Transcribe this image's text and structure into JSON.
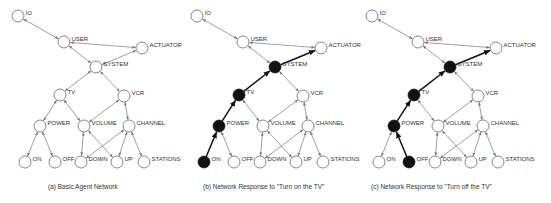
{
  "diagram": {
    "nodes": [
      {
        "id": "IO",
        "label": "IO",
        "x": 18,
        "y": 16
      },
      {
        "id": "USER",
        "label": "USER",
        "x": 64,
        "y": 42
      },
      {
        "id": "ACTUATOR",
        "label": "ACTUATOR",
        "x": 142,
        "y": 48
      },
      {
        "id": "SYSTEM",
        "label": "SYSTEM",
        "x": 96,
        "y": 67
      },
      {
        "id": "TV",
        "label": "TV",
        "x": 60,
        "y": 95
      },
      {
        "id": "VCR",
        "label": "VCR",
        "x": 124,
        "y": 96
      },
      {
        "id": "POWER",
        "label": "POWER",
        "x": 40,
        "y": 126
      },
      {
        "id": "VOLUME",
        "label": "VOLUME",
        "x": 84,
        "y": 126
      },
      {
        "id": "CHANNEL",
        "label": "CHANNEL",
        "x": 129,
        "y": 126
      },
      {
        "id": "ON",
        "label": "ON",
        "x": 25,
        "y": 162
      },
      {
        "id": "OFF",
        "label": "OFF",
        "x": 55,
        "y": 162
      },
      {
        "id": "DOWN",
        "label": "DOWN",
        "x": 81,
        "y": 162
      },
      {
        "id": "UP",
        "label": "UP",
        "x": 117,
        "y": 162
      },
      {
        "id": "STATIONS",
        "label": "STATIONS",
        "x": 144,
        "y": 162
      }
    ],
    "edges": [
      [
        "IO",
        "USER"
      ],
      [
        "USER",
        "ACTUATOR"
      ],
      [
        "USER",
        "SYSTEM"
      ],
      [
        "SYSTEM",
        "ACTUATOR"
      ],
      [
        "SYSTEM",
        "TV"
      ],
      [
        "SYSTEM",
        "VCR"
      ],
      [
        "TV",
        "POWER"
      ],
      [
        "TV",
        "VOLUME"
      ],
      [
        "VCR",
        "VOLUME"
      ],
      [
        "VCR",
        "CHANNEL"
      ],
      [
        "POWER",
        "ON"
      ],
      [
        "POWER",
        "OFF"
      ],
      [
        "VOLUME",
        "DOWN"
      ],
      [
        "VOLUME",
        "UP"
      ],
      [
        "CHANNEL",
        "DOWN"
      ],
      [
        "CHANNEL",
        "UP"
      ],
      [
        "CHANNEL",
        "STATIONS"
      ]
    ],
    "node_radius": 6,
    "colors": {
      "node_fill": "#ffffff",
      "node_stroke": "#555555",
      "active_fill": "#111111",
      "edge": "#777777",
      "active_edge": "#111111"
    }
  },
  "panels": [
    {
      "caption": "(a) Basic Agent Network",
      "offset_x": 0,
      "active_nodes": [],
      "active_path": []
    },
    {
      "caption": "(b) Network Response to \"Turn on the TV\"",
      "offset_x": 179,
      "active_nodes": [
        "ON",
        "POWER",
        "TV",
        "SYSTEM"
      ],
      "active_path": [
        [
          "ON",
          "POWER"
        ],
        [
          "POWER",
          "TV"
        ],
        [
          "TV",
          "SYSTEM"
        ],
        [
          "SYSTEM",
          "ACTUATOR"
        ]
      ]
    },
    {
      "caption": "(c) Network Response to \"Turn off the TV\"",
      "offset_x": 354,
      "active_nodes": [
        "OFF",
        "POWER",
        "TV",
        "SYSTEM"
      ],
      "active_path": [
        [
          "OFF",
          "POWER"
        ],
        [
          "POWER",
          "TV"
        ],
        [
          "TV",
          "SYSTEM"
        ],
        [
          "SYSTEM",
          "ACTUATOR"
        ]
      ]
    }
  ]
}
